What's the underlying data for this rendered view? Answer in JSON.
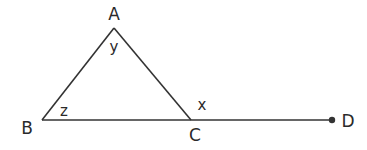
{
  "diagram": {
    "type": "geometry",
    "stroke_color": "#333333",
    "points": {
      "A": {
        "label": "A",
        "x": 114,
        "y": 28
      },
      "B": {
        "label": "B",
        "x": 42,
        "y": 120
      },
      "C": {
        "label": "C",
        "x": 191,
        "y": 120
      },
      "D": {
        "label": "D",
        "x": 332,
        "y": 120
      }
    },
    "segments": [
      {
        "from": "A",
        "to": "B"
      },
      {
        "from": "A",
        "to": "C"
      },
      {
        "from": "B",
        "to": "D"
      }
    ],
    "angles": {
      "y": {
        "label": "y",
        "at": "A"
      },
      "z": {
        "label": "z",
        "at": "B"
      },
      "x": {
        "label": "x",
        "at": "C"
      }
    }
  }
}
